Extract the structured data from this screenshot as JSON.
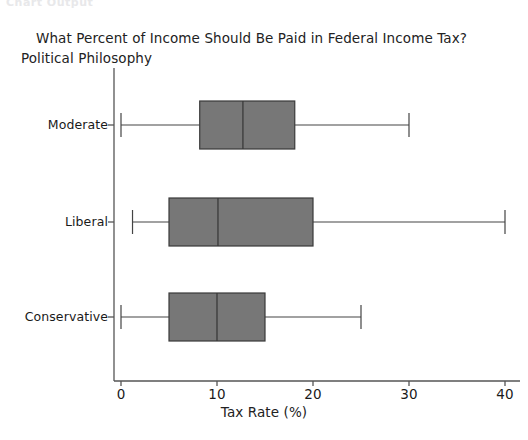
{
  "watermark": "Chart Output",
  "chart_data": {
    "type": "box",
    "orientation": "horizontal",
    "title": "What Percent of Income Should Be Paid in Federal Income Tax?",
    "xlabel": "Tax Rate (%)",
    "ylabel": "Political Philosophy",
    "xlim": [
      0,
      41.5
    ],
    "xticks": [
      0,
      10,
      20,
      30,
      40
    ],
    "xtick_labels": [
      "0",
      "10",
      "20",
      "30",
      "40"
    ],
    "grid": false,
    "legend": null,
    "box_fill_color": "#777777",
    "box_edge_color": "#3a3a3a",
    "axis_color": "#555555",
    "categories": [
      "Moderate",
      "Liberal",
      "Conservative"
    ],
    "boxes": [
      {
        "label": "Moderate",
        "whisker_low": 0.0,
        "q1": 8.2,
        "median": 12.7,
        "q3": 18.1,
        "whisker_high": 30.0,
        "outliers": []
      },
      {
        "label": "Liberal",
        "whisker_low": 1.2,
        "q1": 5.0,
        "median": 10.1,
        "q3": 20.0,
        "whisker_high": 40.0,
        "outliers": []
      },
      {
        "label": "Conservative",
        "whisker_low": 0.0,
        "q1": 5.0,
        "median": 10.0,
        "q3": 15.0,
        "whisker_high": 25.0,
        "outliers": []
      }
    ]
  },
  "geometry": {
    "x_pixel_at_zero": 121,
    "x_pixel_per_unit": 9.6,
    "axis_x_line_y": 381,
    "axis_y_line_x": 114,
    "axis_y_top": 68,
    "row_centers": [
      125,
      222,
      317
    ],
    "box_half_height": 24
  }
}
